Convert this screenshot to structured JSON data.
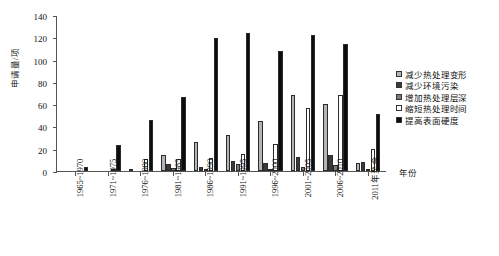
{
  "chart_data": {
    "type": "bar",
    "title": "",
    "xlabel": "年份",
    "ylabel": "申请量/项",
    "ylim": [
      0,
      140
    ],
    "yticks": [
      0,
      20,
      40,
      60,
      80,
      100,
      120,
      140
    ],
    "grid": false,
    "legend_position": "right",
    "categories": [
      "1965~1970",
      "1971~1975",
      "1976~1980",
      "1981~1985",
      "1986~1990",
      "1991~1995",
      "1996~2000",
      "2001~2005",
      "2006~2010",
      "2011年至今"
    ],
    "series": [
      {
        "name": "减少热处理变形",
        "color": "#b4b4b4",
        "values": [
          0,
          0,
          2,
          14,
          26,
          32,
          45,
          68,
          60,
          7
        ]
      },
      {
        "name": "减少环境污染",
        "color": "#3a3a3a",
        "values": [
          0,
          0,
          0,
          6,
          4,
          9,
          7,
          13,
          14,
          8
        ]
      },
      {
        "name": "增加热处理层深",
        "color": "#7d7d7d",
        "values": [
          0,
          0,
          0,
          3,
          2,
          6,
          2,
          4,
          5,
          2
        ]
      },
      {
        "name": "缩短热处理时间",
        "color": "#ffffff",
        "values": [
          0,
          1,
          11,
          11,
          12,
          15,
          24,
          57,
          68,
          20
        ]
      },
      {
        "name": "提高表面硬度",
        "color": "#0d0d0d",
        "values": [
          4,
          23,
          46,
          66,
          119,
          124,
          108,
          122,
          114,
          51
        ]
      }
    ]
  }
}
